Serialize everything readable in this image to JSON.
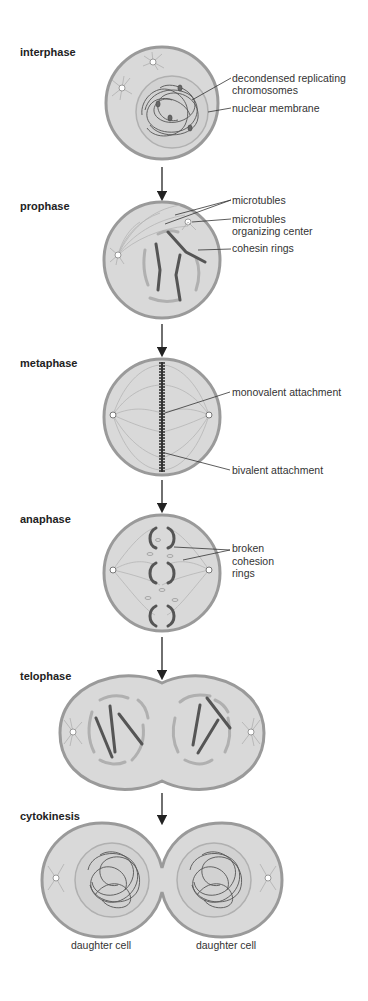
{
  "stages": [
    {
      "name": "interphase",
      "labels": [
        "decondensed replicating",
        "chromosomes",
        "nuclear membrane"
      ]
    },
    {
      "name": "prophase",
      "labels": [
        "microtubles",
        "microtubles",
        "organizing center",
        "cohesin rings"
      ]
    },
    {
      "name": "metaphase",
      "labels": [
        "monovalent attachment",
        "bivalent attachment"
      ]
    },
    {
      "name": "anaphase",
      "labels": [
        "broken",
        "cohesion",
        "rings"
      ]
    },
    {
      "name": "telophase",
      "labels": []
    },
    {
      "name": "cytokinesis",
      "labels": [
        "daughter cell",
        "daughter cell"
      ]
    }
  ],
  "colors": {
    "cytoplasm": "#d9d9d9",
    "membrane": "#9a9a9a",
    "chromosome": "#555555",
    "text": "#333333"
  }
}
